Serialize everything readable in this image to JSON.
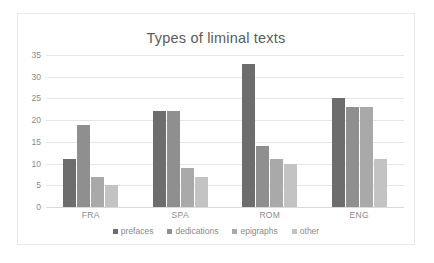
{
  "chart_data": {
    "type": "bar",
    "title": "Types of liminal texts",
    "xlabel": "",
    "ylabel": "",
    "ylim": [
      0,
      35
    ],
    "yticks": [
      0,
      5,
      10,
      15,
      20,
      25,
      30,
      35
    ],
    "ytick_labels": [
      "0",
      "5",
      "10",
      "15",
      "20",
      "25",
      "30",
      "35"
    ],
    "grid": true,
    "legend_position": "bottom",
    "categories": [
      "FRA",
      "SPA",
      "ROM",
      "ENG"
    ],
    "series": [
      {
        "name": "prefaces",
        "color": "#6d6d6d",
        "values": [
          11,
          22,
          33,
          25
        ]
      },
      {
        "name": "dedications",
        "color": "#8f8f8f",
        "values": [
          19,
          22,
          14,
          23
        ]
      },
      {
        "name": "epigraphs",
        "color": "#a9a9a9",
        "values": [
          7,
          9,
          11,
          23
        ]
      },
      {
        "name": "other",
        "color": "#c3c3c3",
        "values": [
          5,
          7,
          10,
          11
        ]
      }
    ]
  },
  "colors": {
    "background": "#ffffff",
    "border": "#e9e9e9",
    "gridline": "#e6e6e6",
    "text": "#8a8a8a",
    "title_text": "#5b5b5b"
  }
}
